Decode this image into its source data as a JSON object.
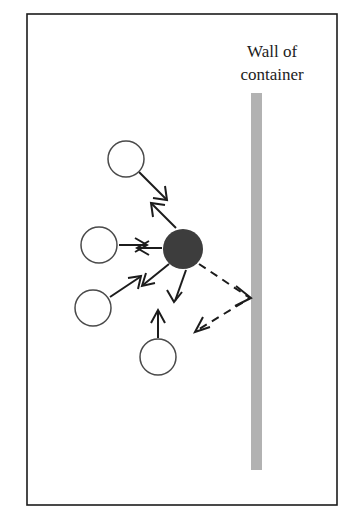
{
  "figure": {
    "title_absent": true,
    "background_color": "#ffffff",
    "frame": {
      "x": 27,
      "y": 14,
      "width": 310,
      "height": 491,
      "stroke_color": "#1c1c1c"
    }
  },
  "labels": {
    "wall_line1": "Wall of",
    "wall_line2": "container",
    "wall_label_x": 272,
    "wall_label_line1_y": 57,
    "wall_label_line2_y": 80,
    "font_size": 17,
    "color": "#1c1c1c"
  },
  "wall": {
    "name": "container-wall",
    "x": 251,
    "y": 93,
    "width": 11,
    "height": 377,
    "color": "#b2b2b2"
  },
  "particle": {
    "name": "brownian-particle",
    "cx": 183,
    "cy": 249,
    "r": 20,
    "color": "#3d3d3d"
  },
  "molecules": [
    {
      "id": "molecule-top-left",
      "cx": 126,
      "cy": 159,
      "r": 18,
      "color": "#ffffff",
      "stroke": "#4a4a4a"
    },
    {
      "id": "molecule-left-upper",
      "cx": 99,
      "cy": 245,
      "r": 18,
      "color": "#ffffff",
      "stroke": "#4a4a4a"
    },
    {
      "id": "molecule-left-lower",
      "cx": 93,
      "cy": 308,
      "r": 18,
      "color": "#ffffff",
      "stroke": "#4a4a4a"
    },
    {
      "id": "molecule-bottom",
      "cx": 158,
      "cy": 357,
      "r": 18,
      "color": "#ffffff",
      "stroke": "#4a4a4a"
    }
  ],
  "collision_arrows": [
    {
      "id": "arrow-from-top-left-molecule",
      "x1": 139,
      "y1": 172,
      "x2": 166,
      "y2": 199,
      "direction": "down-right"
    },
    {
      "id": "arrow-particle-to-top-left",
      "x1": 176,
      "y1": 228,
      "x2": 152,
      "y2": 204,
      "direction": "up-left"
    },
    {
      "id": "arrow-from-left-upper-molecule",
      "x1": 119,
      "y1": 245,
      "x2": 146,
      "y2": 245,
      "direction": "right"
    },
    {
      "id": "arrow-particle-to-left-upper",
      "x1": 162,
      "y1": 248,
      "x2": 138,
      "y2": 248,
      "direction": "left"
    },
    {
      "id": "arrow-from-left-lower-molecule",
      "x1": 110,
      "y1": 297,
      "x2": 140,
      "y2": 277,
      "direction": "up-right"
    },
    {
      "id": "arrow-particle-to-left-lower",
      "x1": 169,
      "y1": 264,
      "x2": 143,
      "y2": 285,
      "direction": "down-left"
    },
    {
      "id": "arrow-from-bottom-molecule",
      "x1": 158,
      "y1": 338,
      "x2": 158,
      "y2": 311,
      "direction": "up"
    },
    {
      "id": "arrow-particle-to-bottom",
      "x1": 186,
      "y1": 270,
      "x2": 175,
      "y2": 301,
      "direction": "down"
    }
  ],
  "trajectory": {
    "id": "dashed-trajectory",
    "incoming_from": {
      "x": 199,
      "y": 264
    },
    "wall_contact": {
      "x": 250,
      "y": 298
    },
    "outgoing_to": {
      "x": 196,
      "y": 331
    },
    "style": "dashed",
    "color": "#1c1c1c"
  },
  "arrow_heads": [
    {
      "id": "head-top-left-molecule",
      "tip_x": 166,
      "tip_y": 199,
      "angle_deg": 45
    },
    {
      "id": "head-particle-top-left",
      "tip_x": 152,
      "tip_y": 204,
      "angle_deg": 225
    },
    {
      "id": "head-left-upper-molecule",
      "tip_x": 146,
      "tip_y": 245,
      "angle_deg": 0
    },
    {
      "id": "head-particle-left-upper",
      "tip_x": 138,
      "tip_y": 248,
      "angle_deg": 180
    },
    {
      "id": "head-left-lower-molecule",
      "tip_x": 140,
      "tip_y": 277,
      "angle_deg": -34
    },
    {
      "id": "head-particle-left-lower",
      "tip_x": 143,
      "tip_y": 285,
      "angle_deg": 141
    },
    {
      "id": "head-bottom-molecule",
      "tip_x": 158,
      "tip_y": 311,
      "angle_deg": 270
    },
    {
      "id": "head-particle-bottom",
      "tip_x": 175,
      "tip_y": 301,
      "angle_deg": 109
    },
    {
      "id": "head-trajectory-wall",
      "tip_x": 250,
      "tip_y": 298,
      "angle_deg": 33
    },
    {
      "id": "head-trajectory-rebound",
      "tip_x": 196,
      "tip_y": 331,
      "angle_deg": 211
    }
  ]
}
